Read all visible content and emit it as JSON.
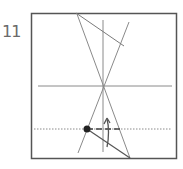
{
  "diagram": {
    "step_number": "11",
    "type": "origami-fold-diagram",
    "colors": {
      "frame": "#555555",
      "lines": "#8a8a8a",
      "dot": "#222222",
      "arrow": "#555555"
    },
    "elements": {
      "frame": "square-paper",
      "center_vertical": "crease-line",
      "center_horizontal": "crease-line",
      "diagonals": [
        "crease-line",
        "crease-line"
      ],
      "top_edge_crease": "crease-line",
      "bottom_edge_crease": "crease-line",
      "valley_fold_line": "dotted-line",
      "mountain_fold_segment": "dashed-line",
      "reference_point": "dot",
      "fold_arrow": "arrow-up"
    }
  }
}
